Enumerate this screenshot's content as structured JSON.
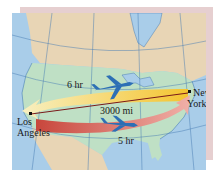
{
  "map": {
    "title": "Cross-country flight times",
    "cities": [
      {
        "name": "New York",
        "line1": "New",
        "line2": "York"
      },
      {
        "name": "Los Angeles",
        "line1": "Los",
        "line2": "Angeles"
      }
    ],
    "distance_label": "3000 mi",
    "westbound": {
      "label": "6 hr",
      "direction": "east-to-west",
      "color_start": "#f4c430",
      "color_end": "#f8efc0"
    },
    "eastbound": {
      "label": "5 hr",
      "direction": "west-to-east",
      "color_start": "#c8463c",
      "color_end": "#f0b0a8"
    },
    "colors": {
      "ocean": "#a9cde9",
      "usa": "#bfe0c5",
      "canada_mexico": "#e8d5b5",
      "plane": "#2d6fb5",
      "distance_line": "#7a1a1a",
      "backing": "#e6cfd0"
    },
    "icons": [
      "airplane-icon",
      "airplane-icon",
      "city-marker-icon",
      "city-marker-icon"
    ]
  }
}
